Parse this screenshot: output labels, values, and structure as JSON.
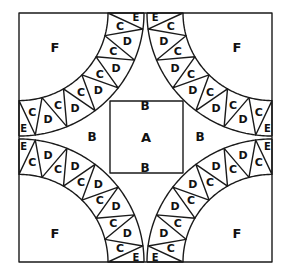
{
  "diagram": {
    "type": "quilt-block-pattern",
    "square": {
      "x": 19,
      "y": 13,
      "width": 253,
      "height": 249
    },
    "center_square": {
      "x": 110,
      "y": 101,
      "width": 73,
      "height": 72,
      "label": "A"
    },
    "arcs": {
      "inner_radius": 89,
      "outer_radius": 125,
      "segments_per_arc": 6,
      "sequence": [
        "E",
        "C",
        "D",
        "C",
        "D",
        "C",
        "D",
        "C",
        "D",
        "C",
        "D",
        "C",
        "E"
      ],
      "corners": [
        "top-left",
        "top-right",
        "bottom-right",
        "bottom-left"
      ]
    },
    "labels": {
      "A": "A",
      "B": "B",
      "C": "C",
      "D": "D",
      "E": "E",
      "F": "F"
    },
    "region_labels": [
      {
        "text": "F",
        "x": 55,
        "y": 47,
        "size": 13
      },
      {
        "text": "F",
        "x": 237,
        "y": 47,
        "size": 13
      },
      {
        "text": "F",
        "x": 55,
        "y": 233,
        "size": 13
      },
      {
        "text": "F",
        "x": 237,
        "y": 233,
        "size": 13
      },
      {
        "text": "B",
        "x": 145,
        "y": 106,
        "size": 12
      },
      {
        "text": "B",
        "x": 92,
        "y": 137,
        "size": 12
      },
      {
        "text": "B",
        "x": 200,
        "y": 137,
        "size": 12
      },
      {
        "text": "B",
        "x": 145,
        "y": 168,
        "size": 12
      },
      {
        "text": "A",
        "x": 146,
        "y": 137,
        "size": 13
      }
    ],
    "colors": {
      "line": "#1a1a1a",
      "text": "#111111",
      "background": "#ffffff"
    }
  }
}
